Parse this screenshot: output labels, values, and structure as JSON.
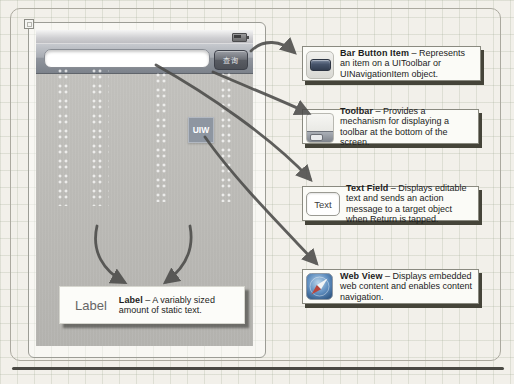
{
  "figure": {
    "designer": {
      "text_field_value": "",
      "toolbar_button_label": "查询",
      "webview_badge": "UIW"
    },
    "callouts": {
      "bar_button_item": {
        "title": "Bar Button Item",
        "description": "– Represents an item on a UIToolbar or UINavigationItem object."
      },
      "toolbar": {
        "title": "Toolbar",
        "description": "– Provides a mechanism for displaying a toolbar at the bottom of the screen."
      },
      "text_field": {
        "title": "Text Field",
        "description": "– Displays editable text and sends an action message to a target object when Return is tapped.",
        "icon_text": "Text"
      },
      "web_view": {
        "title": "Web View",
        "description": "– Displays embedded web content and enables content navigation."
      },
      "label": {
        "title": "Label",
        "description": "– A variably sized amount of static text.",
        "icon_text": "Label"
      }
    },
    "colors": {
      "canvas_gray": "#b9b8b4",
      "toolbar_gray": "#81868e",
      "arrow": "#4b4b49",
      "callout_shadow": "#454439",
      "webview_blue": "#5d8cbe"
    }
  }
}
